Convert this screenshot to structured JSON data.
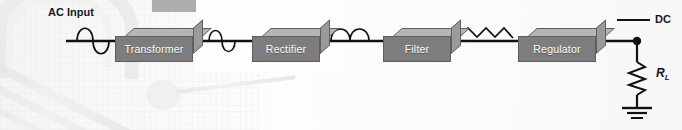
{
  "diagram": {
    "background": "faded grayscale photograph of electronic components on a breadboard",
    "wire_color": "#111111",
    "block_face_color": "#7d7d7d",
    "block_top_color": "#b5b5b5",
    "block_side_color": "#9a9a9a",
    "block_label_color": "#ffffff",
    "text_color": "#121a2b"
  },
  "labels": {
    "ac_input": "AC Input",
    "dc_output": "DC",
    "load_resistor": "R",
    "load_resistor_sub": "L"
  },
  "blocks": [
    {
      "id": "transformer",
      "label": "Transformer",
      "x": 115,
      "y": 28,
      "w": 78,
      "h": 26
    },
    {
      "id": "rectifier",
      "label": "Rectifier",
      "x": 252,
      "y": 28,
      "w": 68,
      "h": 26
    },
    {
      "id": "filter",
      "label": "Filter",
      "x": 383,
      "y": 28,
      "w": 68,
      "h": 26
    },
    {
      "id": "regulator",
      "label": "Regulator",
      "x": 518,
      "y": 28,
      "w": 78,
      "h": 26
    }
  ],
  "waveforms": [
    {
      "id": "ac-sine",
      "type": "sine",
      "after": "ac-input",
      "cycles": 1,
      "description": "full AC sine wave"
    },
    {
      "id": "stepped-sine",
      "type": "sine",
      "after": "transformer",
      "cycles": 1,
      "description": "stepped-down AC sine wave"
    },
    {
      "id": "pulsating-dc",
      "type": "rectified",
      "after": "rectifier",
      "humps": 2,
      "description": "full-wave rectified pulsating DC"
    },
    {
      "id": "ripple",
      "type": "sawtooth",
      "after": "filter",
      "teeth": 3,
      "description": "filtered DC with ripple"
    },
    {
      "id": "regulated-dc",
      "type": "flat",
      "after": "regulator",
      "description": "constant regulated DC level"
    }
  ],
  "symbols": [
    {
      "id": "junction-dot",
      "name": "junction-node"
    },
    {
      "id": "resistor",
      "name": "load-resistor-zigzag"
    },
    {
      "id": "ground",
      "name": "earth-ground-symbol"
    }
  ]
}
